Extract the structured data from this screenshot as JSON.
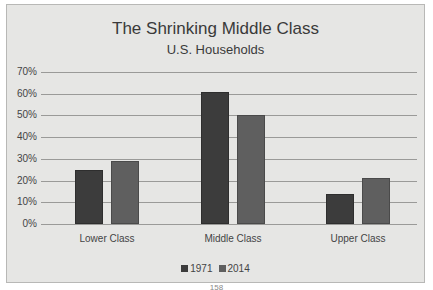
{
  "chart_data": {
    "type": "bar",
    "title": "The Shrinking Middle Class",
    "subtitle": "U.S. Households",
    "categories": [
      "Lower Class",
      "Middle Class",
      "Upper Class"
    ],
    "series": [
      {
        "name": "1971",
        "values": [
          25,
          61,
          14
        ],
        "color": "#3c3c3c"
      },
      {
        "name": "2014",
        "values": [
          29,
          50,
          21
        ],
        "color": "#5f5f5f"
      }
    ],
    "xlabel": "",
    "ylabel": "",
    "ylim": [
      0,
      70
    ],
    "yticks": [
      "0%",
      "10%",
      "20%",
      "30%",
      "40%",
      "50%",
      "60%",
      "70%"
    ],
    "grid": true,
    "legend_position": "bottom"
  },
  "footer": {
    "page_number": "158"
  }
}
